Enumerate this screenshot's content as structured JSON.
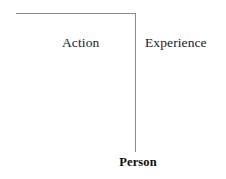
{
  "diagram": {
    "type": "tree-branch-diagram",
    "background_color": "#ffffff",
    "root": {
      "label": "Person",
      "bold": true,
      "color": "#0d0d0d"
    },
    "branches": [
      {
        "label": "Action",
        "side": "left",
        "color": "#1a1a1a"
      },
      {
        "label": "Experience",
        "side": "right",
        "color": "#1a1a1a"
      }
    ],
    "connector": {
      "color": "#8a8a8a",
      "stroke_width": 1,
      "horizontal": {
        "x_start": 16,
        "x_end": 136,
        "y": 13
      },
      "vertical": {
        "x": 135,
        "y_start": 13,
        "y_end": 152
      }
    }
  }
}
